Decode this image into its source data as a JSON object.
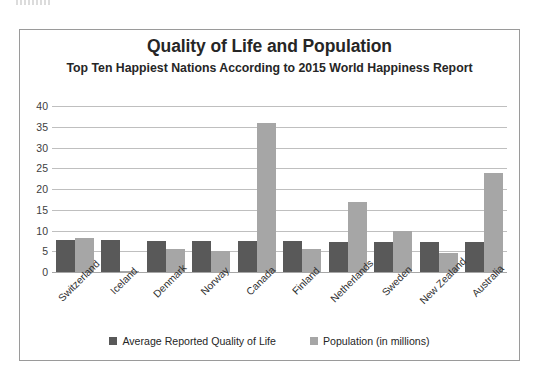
{
  "chart_data": {
    "type": "bar",
    "title": "Quality of Life and Population",
    "subtitle": "Top Ten Happiest Nations According to 2015 World Happiness Report",
    "xlabel": "",
    "ylabel": "",
    "ylim": [
      0,
      40
    ],
    "ytick_step": 5,
    "yticks": [
      40,
      35,
      30,
      25,
      20,
      15,
      10,
      5,
      0
    ],
    "grid": true,
    "legend_position": "bottom",
    "categories": [
      "Switzerland",
      "Iceland",
      "Denmark",
      "Norway",
      "Canada",
      "Finland",
      "Netherlands",
      "Sweden",
      "New Zealand",
      "Australia"
    ],
    "series": [
      {
        "name": "Average Reported Quality of Life",
        "color": "#595959",
        "values": [
          7.6,
          7.6,
          7.5,
          7.5,
          7.4,
          7.4,
          7.3,
          7.3,
          7.3,
          7.3
        ]
      },
      {
        "name": "Population (in millions)",
        "color": "#a6a6a6",
        "values": [
          8.3,
          0.3,
          5.6,
          5.1,
          35.8,
          5.5,
          16.9,
          9.8,
          4.5,
          23.8
        ]
      }
    ]
  },
  "legend": {
    "items": [
      {
        "label": "Average Reported Quality of Life"
      },
      {
        "label": "Population (in millions)"
      }
    ]
  },
  "colors": {
    "quality_of_life": "#595959",
    "population": "#a6a6a6",
    "gridline": "#bfbfbf",
    "frame": "#9a9a9a"
  }
}
